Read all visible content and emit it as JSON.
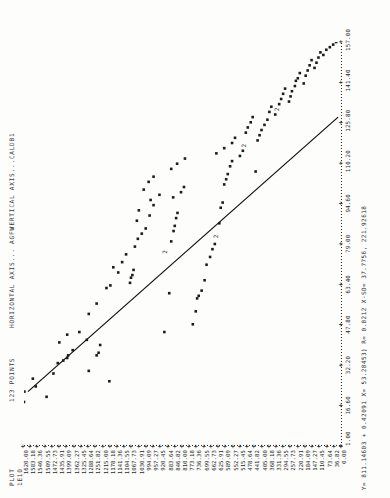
{
  "header": {
    "plot_label": "PLOT",
    "plot_id": "1E10",
    "dash": "d....",
    "points": "123 POINTS",
    "horizontal_axis": "HORIZONTAL AXIS... AGFW",
    "vertical_axis": "VERTICAL AXIS...CALDB1"
  },
  "equation": "Y= 811.14603 +   0.42091 X=  53.28453) R=  0.8212 X-SD=  37.7756, 221.92618",
  "chart_data": {
    "type": "scatter",
    "xlabel": "HORIZONTAL AXIS... AGFW",
    "ylabel": "VERTICAL AXIS...CALDB1",
    "grid": false,
    "legend": "none",
    "xlim": [
      1.0,
      157.0
    ],
    "ylim": [
      0.0,
      1620.0
    ],
    "xticks": [
      1.0,
      16.6,
      32.2,
      47.8,
      63.4,
      79.0,
      94.6,
      110.2,
      125.8,
      141.4,
      157.0
    ],
    "yticks": [
      1620.0,
      1583.18,
      1546.36,
      1509.55,
      1472.73,
      1435.91,
      1399.09,
      1362.27,
      1325.45,
      1288.64,
      1251.82,
      1215.0,
      1178.18,
      1141.36,
      1104.55,
      1067.73,
      1030.91,
      994.09,
      957.27,
      920.45,
      883.64,
      846.82,
      810.0,
      773.18,
      736.36,
      699.55,
      662.73,
      625.91,
      589.09,
      552.27,
      515.45,
      478.64,
      441.82,
      405.0,
      368.18,
      331.36,
      294.55,
      257.73,
      220.91,
      184.09,
      147.27,
      110.45,
      73.64,
      36.82,
      0.0
    ],
    "regression": {
      "intercept": 811.14603,
      "slope": -5.0,
      "r": 0.8212,
      "x_start": 22.0,
      "y_start": 1600.0,
      "x_end": 128.0,
      "y_end": 20.0
    },
    "points": [
      {
        "x": 18,
        "y": 1620,
        "n": 1
      },
      {
        "x": 22,
        "y": 1618,
        "n": 1
      },
      {
        "x": 24,
        "y": 1560,
        "n": 1
      },
      {
        "x": 27,
        "y": 1575,
        "n": 1
      },
      {
        "x": 20,
        "y": 1505,
        "n": 1
      },
      {
        "x": 29,
        "y": 1470,
        "n": 1
      },
      {
        "x": 33,
        "y": 1448,
        "n": 1
      },
      {
        "x": 34,
        "y": 1420,
        "n": 1
      },
      {
        "x": 35,
        "y": 1400,
        "n": 1
      },
      {
        "x": 36,
        "y": 1395,
        "n": 1
      },
      {
        "x": 38,
        "y": 1372,
        "n": 1
      },
      {
        "x": 41,
        "y": 1440,
        "n": 1
      },
      {
        "x": 44,
        "y": 1400,
        "n": 1
      },
      {
        "x": 45,
        "y": 1338,
        "n": 1
      },
      {
        "x": 42,
        "y": 1300,
        "n": 1
      },
      {
        "x": 30,
        "y": 1290,
        "n": 1
      },
      {
        "x": 36,
        "y": 1250,
        "n": 1
      },
      {
        "x": 37,
        "y": 1240,
        "n": 1
      },
      {
        "x": 40,
        "y": 1232,
        "n": 1
      },
      {
        "x": 52,
        "y": 1290,
        "n": 1
      },
      {
        "x": 56,
        "y": 1250,
        "n": 1
      },
      {
        "x": 26,
        "y": 1185,
        "n": 1
      },
      {
        "x": 62,
        "y": 1200,
        "n": 1
      },
      {
        "x": 63,
        "y": 1180,
        "n": 1
      },
      {
        "x": 68,
        "y": 1140,
        "n": 1
      },
      {
        "x": 70,
        "y": 1165,
        "n": 1
      },
      {
        "x": 72,
        "y": 1120,
        "n": 1
      },
      {
        "x": 75,
        "y": 1100,
        "n": 1
      },
      {
        "x": 64,
        "y": 1080,
        "n": 1
      },
      {
        "x": 66,
        "y": 1075,
        "n": 1
      },
      {
        "x": 67,
        "y": 1068,
        "n": 1
      },
      {
        "x": 69,
        "y": 1062,
        "n": 1
      },
      {
        "x": 78,
        "y": 1055,
        "n": 1
      },
      {
        "x": 81,
        "y": 1040,
        "n": 1
      },
      {
        "x": 83,
        "y": 1020,
        "n": 1
      },
      {
        "x": 85,
        "y": 1000,
        "n": 1
      },
      {
        "x": 88,
        "y": 1045,
        "n": 1
      },
      {
        "x": 92,
        "y": 1035,
        "n": 1
      },
      {
        "x": 90,
        "y": 980,
        "n": 1
      },
      {
        "x": 94,
        "y": 960,
        "n": 1
      },
      {
        "x": 96,
        "y": 975,
        "n": 1
      },
      {
        "x": 98,
        "y": 930,
        "n": 1
      },
      {
        "x": 100,
        "y": 1010,
        "n": 1
      },
      {
        "x": 103,
        "y": 985,
        "n": 1
      },
      {
        "x": 105,
        "y": 960,
        "n": 1
      },
      {
        "x": 45,
        "y": 905,
        "n": 1
      },
      {
        "x": 60,
        "y": 880,
        "n": 1
      },
      {
        "x": 76,
        "y": 900,
        "n": 2
      },
      {
        "x": 80,
        "y": 870,
        "n": 1
      },
      {
        "x": 84,
        "y": 858,
        "n": 1
      },
      {
        "x": 86,
        "y": 852,
        "n": 1
      },
      {
        "x": 89,
        "y": 845,
        "n": 1
      },
      {
        "x": 91,
        "y": 838,
        "n": 1
      },
      {
        "x": 97,
        "y": 860,
        "n": 1
      },
      {
        "x": 99,
        "y": 820,
        "n": 1
      },
      {
        "x": 101,
        "y": 805,
        "n": 1
      },
      {
        "x": 108,
        "y": 870,
        "n": 1
      },
      {
        "x": 110,
        "y": 840,
        "n": 1
      },
      {
        "x": 112,
        "y": 800,
        "n": 1
      },
      {
        "x": 48,
        "y": 760,
        "n": 1
      },
      {
        "x": 53,
        "y": 745,
        "n": 1
      },
      {
        "x": 58,
        "y": 738,
        "n": 1
      },
      {
        "x": 59,
        "y": 730,
        "n": 1
      },
      {
        "x": 61,
        "y": 715,
        "n": 1
      },
      {
        "x": 65,
        "y": 700,
        "n": 1
      },
      {
        "x": 71,
        "y": 690,
        "n": 1
      },
      {
        "x": 74,
        "y": 672,
        "n": 1
      },
      {
        "x": 77,
        "y": 660,
        "n": 1
      },
      {
        "x": 79,
        "y": 648,
        "n": 1
      },
      {
        "x": 82,
        "y": 640,
        "n": 2
      },
      {
        "x": 87,
        "y": 625,
        "n": 1
      },
      {
        "x": 93,
        "y": 618,
        "n": 1
      },
      {
        "x": 95,
        "y": 608,
        "n": 1
      },
      {
        "x": 102,
        "y": 600,
        "n": 1
      },
      {
        "x": 104,
        "y": 590,
        "n": 1
      },
      {
        "x": 106,
        "y": 582,
        "n": 1
      },
      {
        "x": 109,
        "y": 570,
        "n": 1
      },
      {
        "x": 111,
        "y": 560,
        "n": 1
      },
      {
        "x": 114,
        "y": 640,
        "n": 1
      },
      {
        "x": 116,
        "y": 600,
        "n": 1
      },
      {
        "x": 118,
        "y": 560,
        "n": 1
      },
      {
        "x": 120,
        "y": 545,
        "n": 1
      },
      {
        "x": 113,
        "y": 520,
        "n": 1
      },
      {
        "x": 115,
        "y": 505,
        "n": 1
      },
      {
        "x": 117,
        "y": 500,
        "n": 2
      },
      {
        "x": 122,
        "y": 490,
        "n": 1
      },
      {
        "x": 124,
        "y": 480,
        "n": 1
      },
      {
        "x": 126,
        "y": 465,
        "n": 1
      },
      {
        "x": 128,
        "y": 455,
        "n": 1
      },
      {
        "x": 107,
        "y": 440,
        "n": 1
      },
      {
        "x": 119,
        "y": 430,
        "n": 1
      },
      {
        "x": 121,
        "y": 420,
        "n": 1
      },
      {
        "x": 123,
        "y": 410,
        "n": 1
      },
      {
        "x": 125,
        "y": 395,
        "n": 1
      },
      {
        "x": 127,
        "y": 380,
        "n": 1
      },
      {
        "x": 130,
        "y": 370,
        "n": 1
      },
      {
        "x": 132,
        "y": 360,
        "n": 1
      },
      {
        "x": 129,
        "y": 340,
        "n": 1
      },
      {
        "x": 131,
        "y": 330,
        "n": 2
      },
      {
        "x": 133,
        "y": 320,
        "n": 1
      },
      {
        "x": 135,
        "y": 310,
        "n": 1
      },
      {
        "x": 137,
        "y": 300,
        "n": 1
      },
      {
        "x": 139,
        "y": 290,
        "n": 1
      },
      {
        "x": 134,
        "y": 270,
        "n": 1
      },
      {
        "x": 136,
        "y": 262,
        "n": 1
      },
      {
        "x": 138,
        "y": 255,
        "n": 1
      },
      {
        "x": 140,
        "y": 240,
        "n": 1
      },
      {
        "x": 142,
        "y": 235,
        "n": 1
      },
      {
        "x": 143,
        "y": 225,
        "n": 1
      },
      {
        "x": 145,
        "y": 215,
        "n": 1
      },
      {
        "x": 141,
        "y": 195,
        "n": 1
      },
      {
        "x": 144,
        "y": 185,
        "n": 1
      },
      {
        "x": 146,
        "y": 175,
        "n": 1
      },
      {
        "x": 148,
        "y": 165,
        "n": 1
      },
      {
        "x": 150,
        "y": 155,
        "n": 1
      },
      {
        "x": 147,
        "y": 140,
        "n": 1
      },
      {
        "x": 149,
        "y": 130,
        "n": 1
      },
      {
        "x": 151,
        "y": 120,
        "n": 1
      },
      {
        "x": 153,
        "y": 110,
        "n": 1
      },
      {
        "x": 152,
        "y": 95,
        "n": 1
      },
      {
        "x": 154,
        "y": 80,
        "n": 1
      },
      {
        "x": 155,
        "y": 62,
        "n": 1
      },
      {
        "x": 156,
        "y": 45,
        "n": 1
      },
      {
        "x": 157,
        "y": 30,
        "n": 1
      }
    ]
  }
}
